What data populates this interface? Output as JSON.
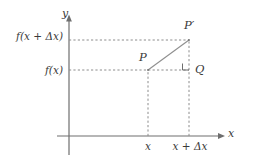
{
  "figure": {
    "kind": "difference-quotient-secant-diagram",
    "background_color": "#ffffff",
    "line_color": "#6e6e6e",
    "dash_color": "#8c8c8c",
    "text_color": "#3a3a3a",
    "axes": {
      "y_axis_label": "y",
      "x_axis_label": "x",
      "y_axis_x_px": 69,
      "x_axis_y_px": 136
    },
    "y_ticks": [
      {
        "id": "f-x-plus-delta-x",
        "label": "f(x + Δx)",
        "y_px": 40
      },
      {
        "id": "f-x",
        "label": "f(x)",
        "y_px": 70
      }
    ],
    "x_ticks": [
      {
        "id": "x",
        "label": "x",
        "x_px": 148
      },
      {
        "id": "x-plus-delta-x",
        "label": "x + Δx",
        "x_px": 190
      }
    ],
    "points": [
      {
        "id": "p",
        "label": "P",
        "x_px": 148,
        "y_px": 70
      },
      {
        "id": "p-prime",
        "label": "P′",
        "x_px": 189,
        "y_px": 40
      },
      {
        "id": "q",
        "label": "Q",
        "x_px": 189,
        "y_px": 70
      }
    ],
    "right_angle_marker_at": "q"
  }
}
